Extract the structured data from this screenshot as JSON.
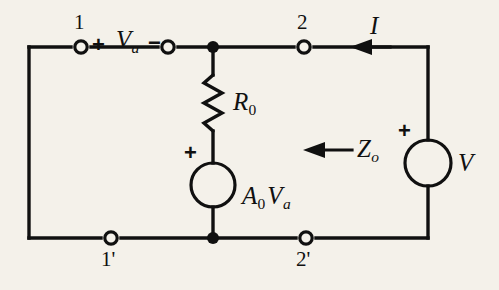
{
  "figure": {
    "type": "circuit-schematic",
    "background_color": "#f4f1ea",
    "ink_color": "#101010"
  },
  "terminals": {
    "top_left": "1",
    "top_right": "2",
    "bottom_left": "1'",
    "bottom_right": "2'"
  },
  "labels": {
    "input_voltage": {
      "symbol": "V",
      "subscript": "a"
    },
    "input_plus": "+",
    "input_minus": "−",
    "resistor": {
      "symbol": "R",
      "subscript": "0"
    },
    "dependent_source": {
      "gain": "A",
      "gain_subscript": "0",
      "symbol": "V",
      "symbol_subscript": "a"
    },
    "dependent_source_plus": "+",
    "current": "I",
    "output_impedance": {
      "symbol": "Z",
      "subscript": "o"
    },
    "source_voltage": "V",
    "source_plus": "+"
  },
  "components": [
    {
      "name": "resistor-R0",
      "kind": "resistor",
      "label": "R0"
    },
    {
      "name": "dependent-voltage-source",
      "kind": "dependent-source",
      "label": "A0Va"
    },
    {
      "name": "independent-voltage-source",
      "kind": "source",
      "label": "V"
    }
  ],
  "annotations": [
    {
      "name": "current-arrow",
      "label": "I",
      "direction": "left"
    },
    {
      "name": "impedance-arrow",
      "label": "Zo",
      "direction": "left"
    }
  ]
}
